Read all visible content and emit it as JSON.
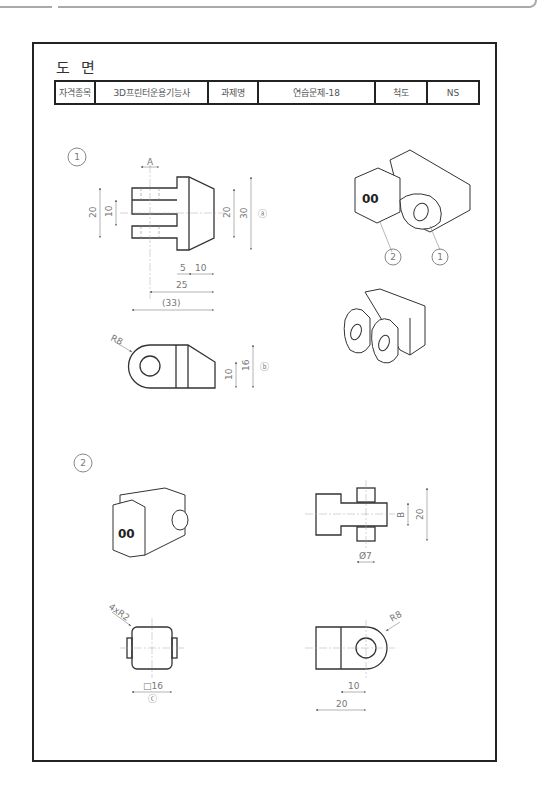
{
  "document": {
    "title": "도 면",
    "header_table": {
      "qualification_label": "자격종목",
      "qualification_value": "3D프린터운용기능사",
      "task_label": "과제명",
      "task_value": "연습문제-18",
      "scale_label": "척도",
      "scale_value": "NS"
    }
  },
  "part1": {
    "number": "1",
    "front_view_dims": {
      "A": "A",
      "d20_left": "20",
      "d10": "10",
      "d20_right": "20",
      "d30": "30",
      "ref_a": "ⓐ",
      "d5": "5",
      "d10_bottom": "10",
      "d25": "25",
      "d33": "(33)"
    },
    "side_view_dims": {
      "r8": "R8",
      "d10": "10",
      "d16": "16",
      "ref_b": "ⓑ"
    },
    "iso_callouts": [
      "2",
      "1"
    ]
  },
  "part2": {
    "number": "2",
    "top_view_dims": {
      "b": "B",
      "d20": "20",
      "phi7": "Ø7"
    },
    "front_view_dims": {
      "r2": "4xR2",
      "sq16": "□16",
      "ref_c": "ⓒ"
    },
    "side_view_dims": {
      "r8": "R8",
      "d10": "10",
      "d20": "20"
    }
  }
}
